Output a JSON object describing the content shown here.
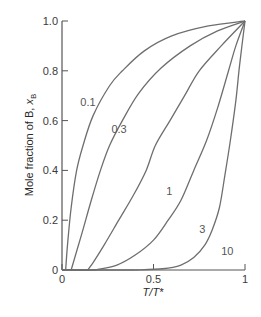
{
  "chart_data": {
    "type": "line",
    "title": "",
    "xlabel": "T/T*",
    "ylabel": "Mole fraction of B, x_B",
    "xlim": [
      0,
      1
    ],
    "ylim": [
      0,
      1
    ],
    "grid": false,
    "legend": "none (curves labelled inline)",
    "x_ticks": [
      {
        "value": 0,
        "label": "0"
      },
      {
        "value": 0.5,
        "label": "0.5"
      },
      {
        "value": 1,
        "label": "1"
      }
    ],
    "y_ticks": [
      {
        "value": 0,
        "label": "0"
      },
      {
        "value": 0.2,
        "label": "0.2"
      },
      {
        "value": 0.4,
        "label": "0.4"
      },
      {
        "value": 0.6,
        "label": "0.6"
      },
      {
        "value": 0.8,
        "label": "0.8"
      },
      {
        "value": 1.0,
        "label": "1.0"
      }
    ],
    "series": [
      {
        "name": "0.1",
        "label_pos": [
          0.1,
          0.66
        ],
        "points": [
          [
            0.02,
            0
          ],
          [
            0.03,
            0.1
          ],
          [
            0.05,
            0.25
          ],
          [
            0.08,
            0.4
          ],
          [
            0.115,
            0.5
          ],
          [
            0.17,
            0.62
          ],
          [
            0.26,
            0.74
          ],
          [
            0.33,
            0.8
          ],
          [
            0.45,
            0.88
          ],
          [
            0.6,
            0.94
          ],
          [
            0.8,
            0.98
          ],
          [
            1,
            1
          ]
        ]
      },
      {
        "name": "0.3",
        "label_pos": [
          0.27,
          0.55
        ],
        "points": [
          [
            0.05,
            0
          ],
          [
            0.07,
            0.05
          ],
          [
            0.11,
            0.15
          ],
          [
            0.16,
            0.28
          ],
          [
            0.21,
            0.4
          ],
          [
            0.26,
            0.5
          ],
          [
            0.33,
            0.6
          ],
          [
            0.42,
            0.71
          ],
          [
            0.54,
            0.81
          ],
          [
            0.7,
            0.9
          ],
          [
            0.85,
            0.96
          ],
          [
            1,
            1
          ]
        ]
      },
      {
        "name": "1",
        "label_pos": [
          0.57,
          0.3
        ],
        "points": [
          [
            0.14,
            0
          ],
          [
            0.17,
            0.03
          ],
          [
            0.23,
            0.1
          ],
          [
            0.31,
            0.2
          ],
          [
            0.39,
            0.3
          ],
          [
            0.46,
            0.4
          ],
          [
            0.51,
            0.5
          ],
          [
            0.59,
            0.6
          ],
          [
            0.67,
            0.7
          ],
          [
            0.75,
            0.8
          ],
          [
            0.87,
            0.9
          ],
          [
            1,
            1
          ]
        ]
      },
      {
        "name": "3",
        "label_pos": [
          0.75,
          0.15
        ],
        "points": [
          [
            0.18,
            0
          ],
          [
            0.3,
            0.02
          ],
          [
            0.4,
            0.06
          ],
          [
            0.5,
            0.12
          ],
          [
            0.58,
            0.2
          ],
          [
            0.65,
            0.28
          ],
          [
            0.72,
            0.4
          ],
          [
            0.79,
            0.52
          ],
          [
            0.85,
            0.65
          ],
          [
            0.91,
            0.8
          ],
          [
            0.95,
            0.9
          ],
          [
            1,
            1
          ]
        ]
      },
      {
        "name": "10",
        "label_pos": [
          0.87,
          0.06
        ],
        "points": [
          [
            0.4,
            0
          ],
          [
            0.55,
            0.005
          ],
          [
            0.65,
            0.02
          ],
          [
            0.72,
            0.05
          ],
          [
            0.78,
            0.1
          ],
          [
            0.82,
            0.16
          ],
          [
            0.86,
            0.25
          ],
          [
            0.89,
            0.38
          ],
          [
            0.92,
            0.52
          ],
          [
            0.95,
            0.68
          ],
          [
            0.97,
            0.82
          ],
          [
            1,
            1
          ]
        ]
      }
    ]
  },
  "styles": {
    "axis_color": "#555555",
    "curve_color": "#6e6e6e",
    "text_color": "#3a3a3a"
  }
}
